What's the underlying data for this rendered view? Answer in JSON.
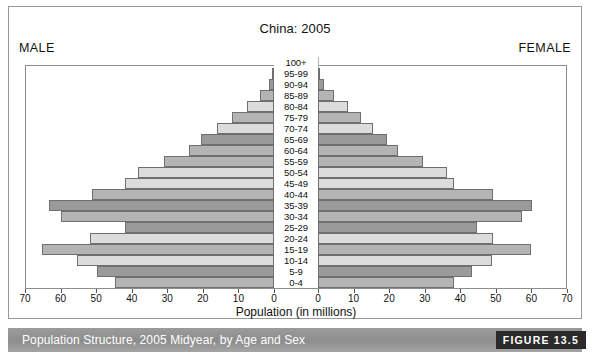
{
  "figure": {
    "title": "China: 2005",
    "male_label": "MALE",
    "female_label": "FEMALE",
    "axis_title": "Population (in millions)",
    "caption": "Population Structure, 2005 Midyear, by Age and Sex",
    "figure_number": "FIGURE 13.5"
  },
  "palette": {
    "bar_light": "#dcdcdc",
    "bar_mid": "#b4b4b4",
    "bar_dark": "#9a9a9a",
    "bar_border": "#6f6f6f",
    "frame": "#8d8d8d",
    "caption_bar": "#969696",
    "badge": "#2b2b2b",
    "text": "#111111"
  },
  "chart_data": {
    "type": "bar",
    "subtype": "population-pyramid",
    "title": "China: 2005",
    "xlabel": "Population (in millions)",
    "ylabel": "",
    "grid": false,
    "legend_position": "none",
    "xlim": [
      0,
      70
    ],
    "xticks": [
      70,
      60,
      50,
      40,
      30,
      20,
      10,
      0,
      0,
      10,
      20,
      30,
      40,
      50,
      60,
      70
    ],
    "categories": [
      "0-4",
      "5-9",
      "10-14",
      "15-19",
      "20-24",
      "25-29",
      "30-34",
      "35-39",
      "40-44",
      "45-49",
      "50-54",
      "55-59",
      "60-64",
      "65-69",
      "70-74",
      "75-79",
      "80-84",
      "85-89",
      "90-94",
      "95-99",
      "100+"
    ],
    "series": [
      {
        "name": "MALE",
        "side": "left",
        "values": [
          45.0,
          50.0,
          55.5,
          65.5,
          52.0,
          42.0,
          60.0,
          63.5,
          51.5,
          42.0,
          38.5,
          31.0,
          24.0,
          20.5,
          16.0,
          12.0,
          7.5,
          4.0,
          1.5,
          0.4,
          0.1
        ]
      },
      {
        "name": "FEMALE",
        "side": "right",
        "values": [
          38.5,
          43.5,
          49.0,
          60.0,
          49.5,
          45.0,
          57.5,
          60.5,
          49.5,
          38.5,
          36.5,
          29.5,
          22.5,
          19.5,
          15.5,
          12.0,
          8.5,
          4.5,
          1.8,
          0.5,
          0.1
        ]
      }
    ],
    "bar_shades": [
      "mid",
      "dark",
      "light",
      "mid",
      "light",
      "dark",
      "mid",
      "dark",
      "mid",
      "light",
      "light",
      "mid",
      "mid",
      "dark",
      "light",
      "mid",
      "light",
      "mid",
      "dark",
      "light",
      "mid"
    ]
  }
}
